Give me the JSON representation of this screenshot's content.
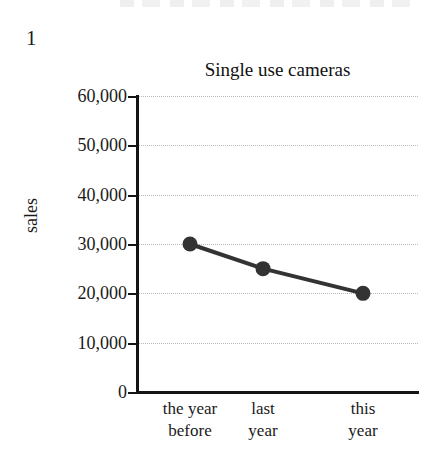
{
  "page": {
    "question_number": "1",
    "background_color": "#ffffff"
  },
  "chart_data": {
    "type": "line",
    "title": "Single use cameras",
    "xlabel": "",
    "ylabel": "sales",
    "categories": [
      "the year\nbefore",
      "last\nyear",
      "this\nyear"
    ],
    "values": [
      30000,
      25000,
      20000
    ],
    "ylim": [
      0,
      60000
    ],
    "ytick_labels": [
      "60,000",
      "50,000",
      "40,000",
      "30,000",
      "20,000",
      "10,000",
      "0"
    ],
    "ytick_values": [
      60000,
      50000,
      40000,
      30000,
      20000,
      10000,
      0
    ],
    "grid": true,
    "grid_color": "#b9b9b9",
    "legend": false,
    "legend_position": "none",
    "series_color": "#333333",
    "marker": "circle",
    "axis_color": "#141414"
  }
}
